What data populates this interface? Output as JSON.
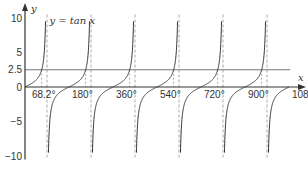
{
  "chart_data": {
    "type": "line",
    "title": "",
    "annotation": "y = tan x",
    "xlabel": "x",
    "ylabel": "y",
    "xlim": [
      0,
      1080
    ],
    "ylim": [
      -10,
      10
    ],
    "x_tick_labels": [
      "68.2°",
      "180°",
      "360°",
      "540°",
      "720°",
      "900°",
      "1080°"
    ],
    "x_ticks": [
      68.2,
      180,
      360,
      540,
      720,
      900,
      1080
    ],
    "y_tick_labels": [
      "10",
      "5",
      "2.5",
      "0",
      "−5",
      "−10"
    ],
    "y_ticks": [
      10,
      5,
      2.5,
      0,
      -5,
      -10
    ],
    "series": [
      {
        "name": "y = tan x",
        "function": "tan(x)",
        "domain": [
          0,
          1080
        ]
      },
      {
        "name": "y = 2.5",
        "function": "2.5",
        "domain": [
          0,
          1080
        ]
      }
    ],
    "asymptotes": [
      90,
      270,
      450,
      630,
      810,
      990
    ],
    "intersections_x": [
      68.2,
      248.2,
      428.2,
      608.2,
      788.2,
      968.2
    ],
    "grid": false,
    "legend": "none"
  },
  "colors": {
    "curve": "#333333",
    "axis": "#333333",
    "hline": "#777777",
    "dashed": "#aaaaaa"
  }
}
